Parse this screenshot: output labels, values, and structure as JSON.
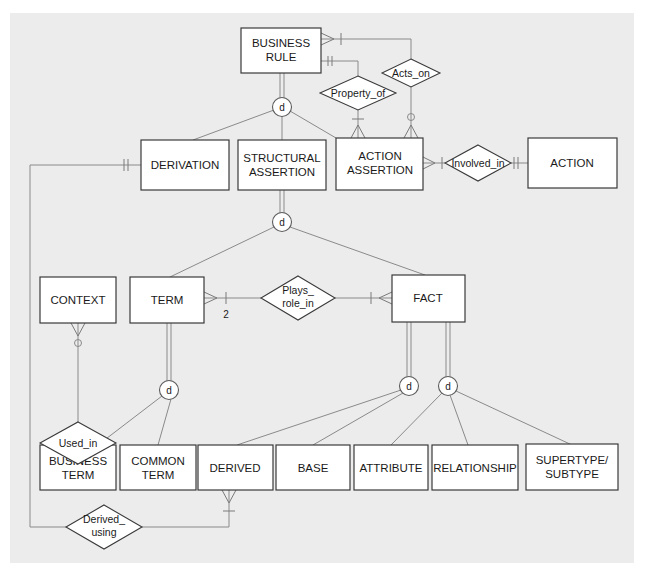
{
  "diagram": {
    "type": "ER diagram (business rules metamodel)",
    "background_color": "#ececec",
    "entities": [
      {
        "id": "business_rule",
        "line1": "BUSINESS",
        "line2": "RULE"
      },
      {
        "id": "derivation",
        "line1": "DERIVATION",
        "line2": ""
      },
      {
        "id": "structural_assertion",
        "line1": "STRUCTURAL",
        "line2": "ASSERTION"
      },
      {
        "id": "action_assertion",
        "line1": "ACTION",
        "line2": "ASSERTION"
      },
      {
        "id": "action",
        "line1": "ACTION",
        "line2": ""
      },
      {
        "id": "context",
        "line1": "CONTEXT",
        "line2": ""
      },
      {
        "id": "term",
        "line1": "TERM",
        "line2": ""
      },
      {
        "id": "fact",
        "line1": "FACT",
        "line2": ""
      },
      {
        "id": "business_term",
        "line1": "BUSINESS",
        "line2": "TERM"
      },
      {
        "id": "common_term",
        "line1": "COMMON",
        "line2": "TERM"
      },
      {
        "id": "derived",
        "line1": "DERIVED",
        "line2": ""
      },
      {
        "id": "base",
        "line1": "BASE",
        "line2": ""
      },
      {
        "id": "attribute",
        "line1": "ATTRIBUTE",
        "line2": ""
      },
      {
        "id": "relationship",
        "line1": "RELATIONSHIP",
        "line2": ""
      },
      {
        "id": "supertype_subtype",
        "line1": "SUPERTYPE/",
        "line2": "SUBTYPE"
      }
    ],
    "relationships": [
      {
        "id": "acts_on",
        "line1": "Acts_on",
        "line2": ""
      },
      {
        "id": "property_of",
        "line1": "Property_of",
        "line2": ""
      },
      {
        "id": "involved_in",
        "line1": "Involved_in",
        "line2": ""
      },
      {
        "id": "plays_role_in",
        "line1": "Plays_",
        "line2": "role_in"
      },
      {
        "id": "used_in",
        "line1": "Used_in",
        "line2": ""
      },
      {
        "id": "derived_using",
        "line1": "Derived_",
        "line2": "using"
      }
    ],
    "subtype_symbols": [
      {
        "id": "d_business_rule",
        "label": "d"
      },
      {
        "id": "d_structural_assertion",
        "label": "d"
      },
      {
        "id": "d_term",
        "label": "d"
      },
      {
        "id": "d_fact_derivation",
        "label": "d"
      },
      {
        "id": "d_fact_kind",
        "label": "d"
      }
    ],
    "cardinality_labels": {
      "term_plays_role_in": "2"
    }
  }
}
